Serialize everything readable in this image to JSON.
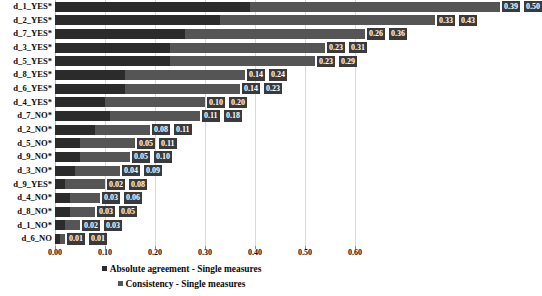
{
  "chart_data": {
    "type": "bar",
    "orientation": "horizontal",
    "stacked": true,
    "title": "",
    "xlabel": "",
    "ylabel": "",
    "xlim": [
      0.0,
      0.6
    ],
    "xticks": [
      "0.00",
      "0.10",
      "0.20",
      "0.30",
      "0.40",
      "0.50",
      "0.60"
    ],
    "xtick_values": [
      0.0,
      0.1,
      0.2,
      0.3,
      0.4,
      0.5,
      0.6
    ],
    "grid": "vertical",
    "legend_position": "bottom",
    "categories": [
      "d_1_YES*",
      "d_2_YES*",
      "d_7_YES*",
      "d_3_YES*",
      "d_5_YES*",
      "d_8_YES*",
      "d_6_YES*",
      "d_4_YES*",
      "d_7_NO*",
      "d_2_NO*",
      "d_5_NO*",
      "d_9_NO*",
      "d_3_NO*",
      "d_9_YES*",
      "d_4_NO*",
      "d_8_NO*",
      "d_1_NO*",
      "d_6_NO"
    ],
    "series": [
      {
        "name": "Absolute agreement - Single measures",
        "color": "#2b2b2b",
        "values": [
          0.39,
          0.33,
          0.26,
          0.23,
          0.23,
          0.14,
          0.14,
          0.1,
          0.11,
          0.08,
          0.05,
          0.05,
          0.04,
          0.02,
          0.03,
          0.03,
          0.02,
          0.01
        ],
        "labels": [
          "0.39",
          "0.33",
          "0.26",
          "0.23",
          "0.23",
          "0.14",
          "0.14",
          "0.10",
          "0.11",
          "0.08",
          "0.05",
          "0.05",
          "0.04",
          "0.02",
          "0.03",
          "0.03",
          "0.02",
          "0.01"
        ]
      },
      {
        "name": "Consistency - Single measures",
        "color": "#555555",
        "values": [
          0.5,
          0.43,
          0.36,
          0.31,
          0.29,
          0.24,
          0.23,
          0.2,
          0.18,
          0.11,
          0.11,
          0.1,
          0.09,
          0.08,
          0.06,
          0.05,
          0.03,
          0.01
        ],
        "labels": [
          "0.50",
          "0.43",
          "0.36",
          "0.31",
          "0.29",
          "0.24",
          "0.23",
          "0.20",
          "0.18",
          "0.11",
          "0.11",
          "0.10",
          "0.09",
          "0.08",
          "0.06",
          "0.05",
          "0.03",
          "0.01"
        ]
      }
    ]
  },
  "legend": {
    "items": [
      "Absolute agreement - Single measures",
      "Consistency - Single measures"
    ]
  }
}
